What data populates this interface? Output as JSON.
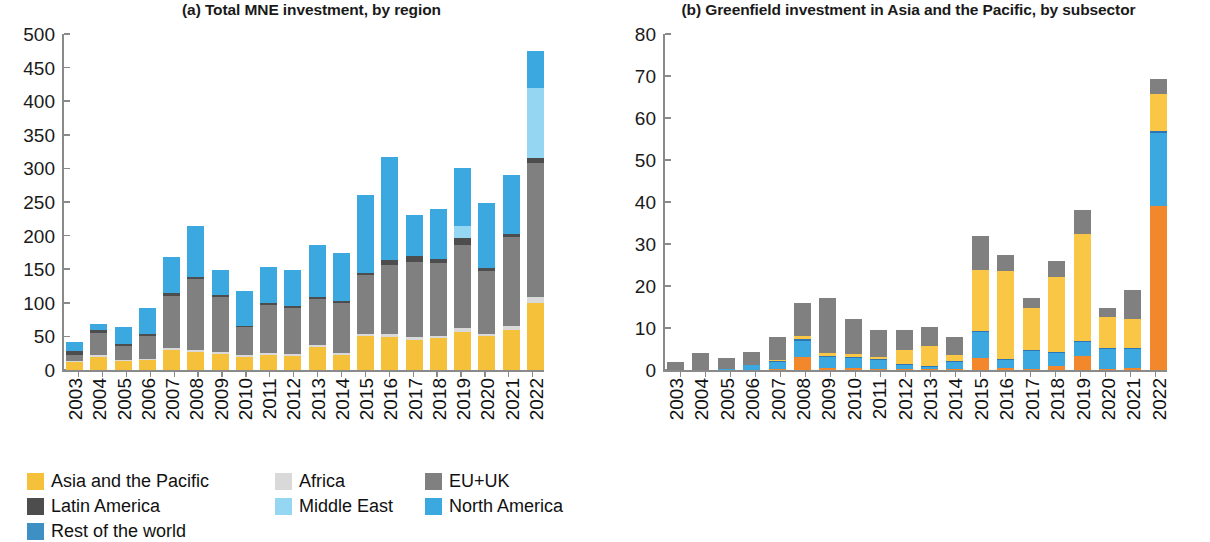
{
  "colors": {
    "asia_pacific": "#F5C13B",
    "africa": "#D9D9D9",
    "eu_uk": "#808080",
    "latin_america": "#4D4D4D",
    "middle_east": "#95D7F2",
    "north_america": "#3BA9DF",
    "rest_of_world": "#3D8FC4",
    "other_subsectors": "#808080",
    "semiconductor_machinery": "#2E75B6",
    "solar_electric_power": "#FAC646",
    "wind_electric_power": "#3BA9DF",
    "other_electric_power": "#F2872C",
    "axis": "#8a8a8a",
    "text": "#1a1a1a",
    "background": "#ffffff"
  },
  "chart_data": [
    {
      "type": "bar",
      "id": "panel-a",
      "title": "(a) Total MNE investment, by region",
      "stacked": true,
      "xlabel": "",
      "ylabel": "",
      "ylim": [
        0,
        500
      ],
      "yticks": [
        0,
        50,
        100,
        150,
        200,
        250,
        300,
        350,
        400,
        450,
        500
      ],
      "grid": false,
      "legend_position": "bottom-left",
      "categories": [
        "2003",
        "2004",
        "2005",
        "2006",
        "2007",
        "2008",
        "2009",
        "2010",
        "2011",
        "2012",
        "2013",
        "2014",
        "2015",
        "2016",
        "2017",
        "2018",
        "2019",
        "2020",
        "2021",
        "2022"
      ],
      "series": [
        {
          "name": "Asia and the Pacific",
          "color_key": "asia_pacific",
          "values": [
            12,
            20,
            13,
            15,
            30,
            27,
            24,
            20,
            22,
            21,
            34,
            23,
            50,
            49,
            45,
            47,
            57,
            50,
            60,
            100
          ]
        },
        {
          "name": "Africa",
          "color_key": "africa",
          "values": [
            2,
            2,
            2,
            2,
            3,
            3,
            3,
            2,
            3,
            3,
            3,
            3,
            4,
            4,
            4,
            4,
            5,
            4,
            5,
            8
          ]
        },
        {
          "name": "EU+UK",
          "color_key": "eu_uk",
          "values": [
            9,
            33,
            21,
            34,
            77,
            105,
            81,
            42,
            72,
            68,
            69,
            74,
            87,
            103,
            112,
            109,
            124,
            94,
            133,
            200
          ]
        },
        {
          "name": "Latin America",
          "color_key": "latin_america",
          "values": [
            5,
            4,
            2,
            3,
            4,
            3,
            3,
            2,
            3,
            3,
            3,
            3,
            3,
            8,
            9,
            5,
            10,
            4,
            5,
            7
          ]
        },
        {
          "name": "Middle East",
          "color_key": "middle_east",
          "values": [
            0,
            0,
            0,
            0,
            0,
            0,
            0,
            0,
            0,
            0,
            0,
            0,
            0,
            0,
            0,
            0,
            19,
            0,
            0,
            105
          ]
        },
        {
          "name": "North America",
          "color_key": "north_america",
          "values": [
            13,
            10,
            26,
            39,
            54,
            77,
            38,
            51,
            53,
            54,
            77,
            71,
            116,
            153,
            60,
            74,
            86,
            96,
            87,
            55
          ]
        },
        {
          "name": "Rest of the world",
          "color_key": "rest_of_world",
          "values": [
            0,
            0,
            0,
            0,
            0,
            0,
            0,
            0,
            0,
            0,
            0,
            0,
            0,
            0,
            0,
            0,
            0,
            0,
            0,
            0
          ]
        }
      ]
    },
    {
      "type": "bar",
      "id": "panel-b",
      "title": "(b) Greenfield investment in Asia and the Pacific, by subsector",
      "stacked": true,
      "xlabel": "",
      "ylabel": "",
      "ylim": [
        0,
        80
      ],
      "yticks": [
        0,
        10,
        20,
        30,
        40,
        50,
        60,
        70,
        80
      ],
      "grid": false,
      "legend_position": "bottom-left",
      "categories": [
        "2003",
        "2004",
        "2005",
        "2006",
        "2007",
        "2008",
        "2009",
        "2010",
        "2011",
        "2012",
        "2013",
        "2014",
        "2015",
        "2016",
        "2017",
        "2018",
        "2019",
        "2020",
        "2021",
        "2022"
      ],
      "series": [
        {
          "name": "Other electric power generation (renewable energy)",
          "color_key": "other_electric_power",
          "values": [
            0,
            0,
            0,
            0,
            0.3,
            3.0,
            0.5,
            0.4,
            0.3,
            0.3,
            0.2,
            0.3,
            2.8,
            0.4,
            0.3,
            1.0,
            3.3,
            0.3,
            0.4,
            39.0
          ]
        },
        {
          "name": "Wind electric power",
          "color_key": "wind_electric_power",
          "values": [
            0,
            0,
            0.3,
            1.2,
            1.5,
            4.0,
            2.5,
            2.5,
            2.0,
            1.0,
            0.5,
            1.5,
            6.3,
            2.0,
            4.2,
            3.0,
            3.4,
            4.8,
            4.6,
            17.5
          ]
        },
        {
          "name": "Semiconductor machinery",
          "color_key": "semiconductor_machinery",
          "values": [
            0,
            0,
            0,
            0,
            0.3,
            0.5,
            0.2,
            0.2,
            0.2,
            0.2,
            0.2,
            0.2,
            0.3,
            0.3,
            0.2,
            0.2,
            0.3,
            0.2,
            0.2,
            0.3
          ]
        },
        {
          "name": "Solar electric power",
          "color_key": "solar_electric_power",
          "values": [
            0,
            0,
            0,
            0,
            0.4,
            0.5,
            0.7,
            0.7,
            0.5,
            3.3,
            4.8,
            1.5,
            14.5,
            21.0,
            10.0,
            18.0,
            25.5,
            7.2,
            7.0,
            9.0
          ]
        },
        {
          "name": "Other subsectors",
          "color_key": "other_subsectors",
          "values": [
            2.0,
            4.1,
            2.5,
            3.2,
            5.4,
            8.0,
            13.1,
            8.2,
            6.5,
            4.7,
            4.5,
            4.3,
            8.0,
            3.8,
            2.5,
            3.8,
            5.5,
            2.3,
            6.8,
            3.5
          ]
        }
      ]
    }
  ],
  "panel_a": {
    "title": "(a) Total MNE investment, by region",
    "yticks": [
      "500",
      "450",
      "400",
      "350",
      "300",
      "250",
      "200",
      "150",
      "100",
      "50",
      "0"
    ],
    "legend": [
      {
        "label": "Asia and the Pacific",
        "color_key": "asia_pacific"
      },
      {
        "label": "Africa",
        "color_key": "africa"
      },
      {
        "label": "EU+UK",
        "color_key": "eu_uk"
      },
      {
        "label": "Latin America",
        "color_key": "latin_america"
      },
      {
        "label": "Middle East",
        "color_key": "middle_east"
      },
      {
        "label": "North America",
        "color_key": "north_america"
      },
      {
        "label": "Rest of the world",
        "color_key": "rest_of_world"
      }
    ]
  },
  "panel_b": {
    "title": "(b) Greenfield investment in Asia and the Pacific, by subsector",
    "yticks": [
      "80",
      "70",
      "60",
      "50",
      "40",
      "30",
      "20",
      "10",
      "0"
    ],
    "legend": [
      {
        "label": "Other subsectors",
        "color_key": "other_subsectors"
      },
      {
        "label": "Semiconductor machinery",
        "color_key": "semiconductor_machinery"
      },
      {
        "label": "Solar electric power",
        "color_key": "solar_electric_power"
      },
      {
        "label": "Wind electric power",
        "color_key": "wind_electric_power"
      },
      {
        "label": "Other electric power generation (renewable energy)",
        "color_key": "other_electric_power"
      }
    ]
  }
}
